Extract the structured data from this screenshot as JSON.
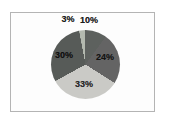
{
  "figure": {
    "background": "#ffffff",
    "frame_border_color": "#b4b4b4",
    "frame_fill": "#fdfdfd"
  },
  "chart_data": {
    "type": "pie",
    "title": "",
    "legend": "none",
    "labels_format": "percent",
    "start_angle_deg": 0,
    "direction": "clockwise",
    "categories": [
      "10%",
      "24%",
      "33%",
      "30%",
      "3%"
    ],
    "values": [
      10,
      24,
      33,
      30,
      3
    ],
    "slices": [
      {
        "label": "10%",
        "value": 10,
        "color": "#5d615e",
        "label_color": "#1c1c1c",
        "label_placement": "outside",
        "label_x": 89,
        "label_y": 20
      },
      {
        "label": "24%",
        "value": 24,
        "color": "#646464",
        "label_color": "#141414",
        "label_placement": "inside",
        "label_x": 105,
        "label_y": 57
      },
      {
        "label": "33%",
        "value": 33,
        "color": "#cacac6",
        "label_color": "#2a2a2a",
        "label_placement": "inside",
        "label_x": 84,
        "label_y": 84
      },
      {
        "label": "30%",
        "value": 30,
        "color": "#575b58",
        "label_color": "#0f0f0f",
        "label_placement": "inside",
        "label_x": 64,
        "label_y": 55
      },
      {
        "label": "3%",
        "value": 3,
        "color": "#b3b9af",
        "label_color": "#1c1c1c",
        "label_placement": "outside",
        "label_x": 68,
        "label_y": 19
      }
    ]
  }
}
